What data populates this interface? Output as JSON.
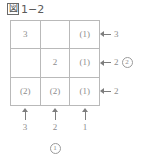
{
  "figure": {
    "badge": "図",
    "label": "1−2"
  },
  "grid": {
    "rows": 3,
    "cols": 3,
    "cells": [
      [
        {
          "text": "3",
          "parenthesized": false
        },
        {
          "text": "",
          "parenthesized": false
        },
        {
          "text": "(1)",
          "parenthesized": true
        }
      ],
      [
        {
          "text": "",
          "parenthesized": false
        },
        {
          "text": "2",
          "parenthesized": false
        },
        {
          "text": "(1)",
          "parenthesized": true
        }
      ],
      [
        {
          "text": "(2)",
          "parenthesized": true
        },
        {
          "text": "(2)",
          "parenthesized": true
        },
        {
          "text": "(1)",
          "parenthesized": true
        }
      ]
    ]
  },
  "row_annotations": [
    {
      "arrow": "arrow-left-icon",
      "value": "3",
      "marker": ""
    },
    {
      "arrow": "arrow-left-icon",
      "value": "2",
      "marker": "2"
    },
    {
      "arrow": "arrow-left-icon",
      "value": "2",
      "marker": ""
    }
  ],
  "col_annotations": [
    {
      "arrow": "arrow-up-icon",
      "value": "3",
      "marker": ""
    },
    {
      "arrow": "arrow-up-icon",
      "value": "2",
      "marker": "1"
    },
    {
      "arrow": "arrow-up-icon",
      "value": "1",
      "marker": ""
    }
  ],
  "colors": {
    "ink": "#8d8d8d",
    "grid_line": "#b9b9b9",
    "arrow": "#7d7d7d",
    "title": "#5a5a5a",
    "background": "#ffffff"
  }
}
